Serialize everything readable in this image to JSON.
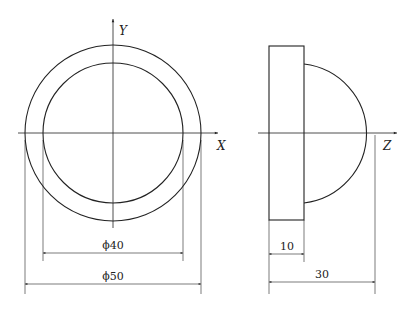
{
  "front_view": {
    "axis_y_label": "Y",
    "axis_x_label": "X",
    "outer_diameter_label": "ϕ40",
    "outer_label": "ϕ50"
  },
  "side_view": {
    "axis_z_label": "Z",
    "flange_thickness_label": "10",
    "total_length_label": "30"
  },
  "dimensions": {
    "inner_diameter": 40,
    "outer_diameter": 50,
    "flange_thickness": 10,
    "total_length": 30
  },
  "colors": {
    "line": "#222222",
    "background": "#ffffff"
  }
}
